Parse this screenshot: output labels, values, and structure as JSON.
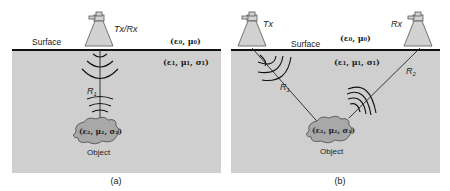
{
  "figure": {
    "colors": {
      "ground": "#cfcfcf",
      "surface_line": "#111111",
      "antenna_fill": "#d2d2d2",
      "antenna_stroke": "#555555",
      "object_fill": "#a8a8a8",
      "object_stroke": "#555555",
      "wave": "#111111"
    },
    "panels": [
      {
        "id": "a",
        "caption": "(a)",
        "surface_label": "Surface",
        "antenna_label": "Tx/Rx",
        "air_params": "(ε₀, μ₀)",
        "ground_params": "(ε₁, μ₁, σ₁)",
        "object_params": "(ε₂, μ₂, σ₂)",
        "object_label": "Object",
        "range_label": "R",
        "range_sub": "1"
      },
      {
        "id": "b",
        "caption": "(b)",
        "surface_label": "Surface",
        "tx_label": "Tx",
        "rx_label": "Rx",
        "air_params": "(ε₀, μ₀)",
        "ground_params": "(ε₁, μ₁, σ₁)",
        "object_params": "(ε₂, μ₂, σ₂)",
        "object_label": "Object",
        "range1_label": "R",
        "range1_sub": "1",
        "range2_label": "R",
        "range2_sub": "2"
      }
    ]
  }
}
